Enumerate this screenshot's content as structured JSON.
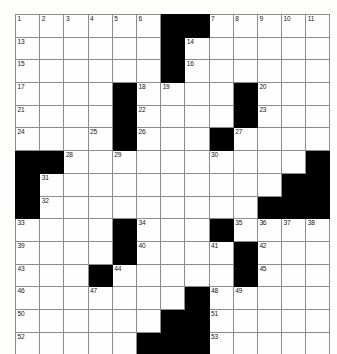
{
  "puzzle": {
    "title": "Crossword Grid",
    "rows": 15,
    "cols": 13,
    "cell_size_px": 23,
    "colors": {
      "block": "#000000",
      "cell": "#fefefe",
      "grid_line": "#8c8c8c",
      "number_text": "#161616"
    },
    "numbers_visible": [
      1,
      2,
      3,
      4,
      5,
      6,
      7,
      8,
      9,
      10,
      11,
      12,
      13,
      14,
      15,
      16,
      17,
      18,
      19,
      20,
      21,
      22,
      23,
      24,
      25,
      26,
      27,
      28,
      29,
      30,
      31,
      32,
      33,
      34,
      35,
      36,
      37,
      38,
      39,
      40,
      41,
      42,
      43,
      44,
      45,
      46,
      47,
      48,
      49,
      50,
      51,
      52,
      53
    ],
    "grid": [
      [
        {
          "block": false,
          "num": "1"
        },
        {
          "block": false,
          "num": "2"
        },
        {
          "block": false,
          "num": "3"
        },
        {
          "block": false,
          "num": "4"
        },
        {
          "block": false,
          "num": "5"
        },
        {
          "block": false,
          "num": "6"
        },
        {
          "block": true,
          "num": ""
        },
        {
          "block": true,
          "num": ""
        },
        {
          "block": false,
          "num": "7"
        },
        {
          "block": false,
          "num": "8"
        },
        {
          "block": false,
          "num": "9"
        },
        {
          "block": false,
          "num": "10"
        },
        {
          "block": false,
          "num": "11"
        }
      ],
      [
        {
          "block": false,
          "num": "13"
        },
        {
          "block": false,
          "num": ""
        },
        {
          "block": false,
          "num": ""
        },
        {
          "block": false,
          "num": ""
        },
        {
          "block": false,
          "num": ""
        },
        {
          "block": false,
          "num": ""
        },
        {
          "block": true,
          "num": ""
        },
        {
          "block": false,
          "num": "14"
        },
        {
          "block": false,
          "num": ""
        },
        {
          "block": false,
          "num": ""
        },
        {
          "block": false,
          "num": ""
        },
        {
          "block": false,
          "num": ""
        },
        {
          "block": false,
          "num": ""
        }
      ],
      [
        {
          "block": false,
          "num": "15"
        },
        {
          "block": false,
          "num": ""
        },
        {
          "block": false,
          "num": ""
        },
        {
          "block": false,
          "num": ""
        },
        {
          "block": false,
          "num": ""
        },
        {
          "block": false,
          "num": ""
        },
        {
          "block": true,
          "num": ""
        },
        {
          "block": false,
          "num": "16"
        },
        {
          "block": false,
          "num": ""
        },
        {
          "block": false,
          "num": ""
        },
        {
          "block": false,
          "num": ""
        },
        {
          "block": false,
          "num": ""
        },
        {
          "block": false,
          "num": ""
        }
      ],
      [
        {
          "block": false,
          "num": "17"
        },
        {
          "block": false,
          "num": ""
        },
        {
          "block": false,
          "num": ""
        },
        {
          "block": false,
          "num": ""
        },
        {
          "block": true,
          "num": ""
        },
        {
          "block": false,
          "num": "18"
        },
        {
          "block": false,
          "num": "19"
        },
        {
          "block": false,
          "num": ""
        },
        {
          "block": false,
          "num": ""
        },
        {
          "block": true,
          "num": ""
        },
        {
          "block": false,
          "num": "20"
        },
        {
          "block": false,
          "num": ""
        },
        {
          "block": false,
          "num": ""
        }
      ],
      [
        {
          "block": false,
          "num": "21"
        },
        {
          "block": false,
          "num": ""
        },
        {
          "block": false,
          "num": ""
        },
        {
          "block": false,
          "num": ""
        },
        {
          "block": true,
          "num": ""
        },
        {
          "block": false,
          "num": "22"
        },
        {
          "block": false,
          "num": ""
        },
        {
          "block": false,
          "num": ""
        },
        {
          "block": false,
          "num": ""
        },
        {
          "block": true,
          "num": ""
        },
        {
          "block": false,
          "num": "23"
        },
        {
          "block": false,
          "num": ""
        },
        {
          "block": false,
          "num": ""
        }
      ],
      [
        {
          "block": false,
          "num": "24"
        },
        {
          "block": false,
          "num": ""
        },
        {
          "block": false,
          "num": ""
        },
        {
          "block": false,
          "num": "25"
        },
        {
          "block": true,
          "num": ""
        },
        {
          "block": false,
          "num": "26"
        },
        {
          "block": false,
          "num": ""
        },
        {
          "block": false,
          "num": ""
        },
        {
          "block": true,
          "num": ""
        },
        {
          "block": false,
          "num": "27"
        },
        {
          "block": false,
          "num": ""
        },
        {
          "block": false,
          "num": ""
        },
        {
          "block": false,
          "num": ""
        }
      ],
      [
        {
          "block": true,
          "num": ""
        },
        {
          "block": true,
          "num": ""
        },
        {
          "block": false,
          "num": "28"
        },
        {
          "block": false,
          "num": ""
        },
        {
          "block": false,
          "num": "29"
        },
        {
          "block": false,
          "num": ""
        },
        {
          "block": false,
          "num": ""
        },
        {
          "block": false,
          "num": ""
        },
        {
          "block": false,
          "num": "30"
        },
        {
          "block": false,
          "num": ""
        },
        {
          "block": false,
          "num": ""
        },
        {
          "block": false,
          "num": ""
        },
        {
          "block": true,
          "num": ""
        }
      ],
      [
        {
          "block": true,
          "num": ""
        },
        {
          "block": false,
          "num": "31"
        },
        {
          "block": false,
          "num": ""
        },
        {
          "block": false,
          "num": ""
        },
        {
          "block": false,
          "num": ""
        },
        {
          "block": false,
          "num": ""
        },
        {
          "block": false,
          "num": ""
        },
        {
          "block": false,
          "num": ""
        },
        {
          "block": false,
          "num": ""
        },
        {
          "block": false,
          "num": ""
        },
        {
          "block": false,
          "num": ""
        },
        {
          "block": true,
          "num": ""
        },
        {
          "block": true,
          "num": ""
        }
      ],
      [
        {
          "block": true,
          "num": ""
        },
        {
          "block": false,
          "num": "32"
        },
        {
          "block": false,
          "num": ""
        },
        {
          "block": false,
          "num": ""
        },
        {
          "block": false,
          "num": ""
        },
        {
          "block": false,
          "num": ""
        },
        {
          "block": false,
          "num": ""
        },
        {
          "block": false,
          "num": ""
        },
        {
          "block": false,
          "num": ""
        },
        {
          "block": false,
          "num": ""
        },
        {
          "block": true,
          "num": ""
        },
        {
          "block": true,
          "num": ""
        },
        {
          "block": true,
          "num": ""
        }
      ],
      [
        {
          "block": false,
          "num": "33"
        },
        {
          "block": false,
          "num": ""
        },
        {
          "block": false,
          "num": ""
        },
        {
          "block": false,
          "num": ""
        },
        {
          "block": true,
          "num": ""
        },
        {
          "block": false,
          "num": "34"
        },
        {
          "block": false,
          "num": ""
        },
        {
          "block": false,
          "num": ""
        },
        {
          "block": true,
          "num": ""
        },
        {
          "block": false,
          "num": "35"
        },
        {
          "block": false,
          "num": "36"
        },
        {
          "block": false,
          "num": "37"
        },
        {
          "block": false,
          "num": "38"
        }
      ],
      [
        {
          "block": false,
          "num": "39"
        },
        {
          "block": false,
          "num": ""
        },
        {
          "block": false,
          "num": ""
        },
        {
          "block": false,
          "num": ""
        },
        {
          "block": true,
          "num": ""
        },
        {
          "block": false,
          "num": "40"
        },
        {
          "block": false,
          "num": ""
        },
        {
          "block": false,
          "num": ""
        },
        {
          "block": false,
          "num": "41"
        },
        {
          "block": true,
          "num": ""
        },
        {
          "block": false,
          "num": "42"
        },
        {
          "block": false,
          "num": ""
        },
        {
          "block": false,
          "num": ""
        }
      ],
      [
        {
          "block": false,
          "num": "43"
        },
        {
          "block": false,
          "num": ""
        },
        {
          "block": false,
          "num": ""
        },
        {
          "block": true,
          "num": ""
        },
        {
          "block": false,
          "num": "44"
        },
        {
          "block": false,
          "num": ""
        },
        {
          "block": false,
          "num": ""
        },
        {
          "block": false,
          "num": ""
        },
        {
          "block": false,
          "num": ""
        },
        {
          "block": true,
          "num": ""
        },
        {
          "block": false,
          "num": "45"
        },
        {
          "block": false,
          "num": ""
        },
        {
          "block": false,
          "num": ""
        }
      ],
      [
        {
          "block": false,
          "num": "46"
        },
        {
          "block": false,
          "num": ""
        },
        {
          "block": false,
          "num": ""
        },
        {
          "block": false,
          "num": "47"
        },
        {
          "block": false,
          "num": ""
        },
        {
          "block": false,
          "num": ""
        },
        {
          "block": false,
          "num": ""
        },
        {
          "block": true,
          "num": ""
        },
        {
          "block": false,
          "num": "48"
        },
        {
          "block": false,
          "num": "49"
        },
        {
          "block": false,
          "num": ""
        },
        {
          "block": false,
          "num": ""
        },
        {
          "block": false,
          "num": ""
        }
      ],
      [
        {
          "block": false,
          "num": "50"
        },
        {
          "block": false,
          "num": ""
        },
        {
          "block": false,
          "num": ""
        },
        {
          "block": false,
          "num": ""
        },
        {
          "block": false,
          "num": ""
        },
        {
          "block": false,
          "num": ""
        },
        {
          "block": true,
          "num": ""
        },
        {
          "block": true,
          "num": ""
        },
        {
          "block": false,
          "num": "51"
        },
        {
          "block": false,
          "num": ""
        },
        {
          "block": false,
          "num": ""
        },
        {
          "block": false,
          "num": ""
        },
        {
          "block": false,
          "num": ""
        }
      ],
      [
        {
          "block": false,
          "num": "52"
        },
        {
          "block": false,
          "num": ""
        },
        {
          "block": false,
          "num": ""
        },
        {
          "block": false,
          "num": ""
        },
        {
          "block": false,
          "num": ""
        },
        {
          "block": true,
          "num": ""
        },
        {
          "block": true,
          "num": ""
        },
        {
          "block": true,
          "num": ""
        },
        {
          "block": false,
          "num": "53"
        },
        {
          "block": false,
          "num": ""
        },
        {
          "block": false,
          "num": ""
        },
        {
          "block": false,
          "num": ""
        },
        {
          "block": false,
          "num": ""
        }
      ]
    ]
  }
}
